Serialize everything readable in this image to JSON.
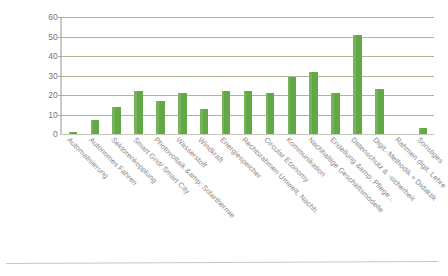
{
  "chart_data": {
    "type": "bar",
    "title": "",
    "subtitle": "",
    "xlabel": "",
    "ylabel": "",
    "ylim": [
      0,
      60
    ],
    "ytick_step": 10,
    "yticks": [
      "60",
      "50",
      "40",
      "30",
      "20",
      "10",
      "0"
    ],
    "grid": true,
    "grid_axis": "y",
    "legend": false,
    "legend_position": "none",
    "bar_color": "#62a844",
    "grid_color": "#9bab86",
    "axis_color": "#c9c9c9",
    "label_color": "#8a8a8a",
    "categories": [
      "Automatisierung",
      "Autonomes Fahren",
      "Sektorenkopplung",
      "Smart Grid/ Smart City",
      "Photovoltaik &amp; Solarthermie",
      "Wasserstoff",
      "Windkraft",
      "Energiespeicher",
      "Rechtsrahmen Umwelt, Nachh.",
      "Circular Economy",
      "Kommunikation",
      "Nachhaltige Geschäftsmodelle",
      "Erstellung &amp; Pflege...",
      "Datenschutz & -sicherheit",
      "Digit.-Methodik + Didaktik",
      "Rahmen digit. Lehre",
      "Sonstiges"
    ],
    "values": [
      1,
      7,
      14,
      22,
      17,
      21,
      13,
      22,
      22,
      21,
      29,
      32,
      21,
      51,
      23,
      0,
      3
    ]
  }
}
